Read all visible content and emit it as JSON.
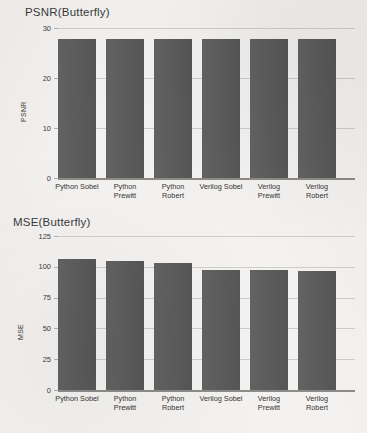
{
  "document": {
    "kind": "scanned-figure-page",
    "background_color": "#f3f2f0",
    "bar_color": "#5a5a5a",
    "grid_color": "#cfcdc9",
    "axis_color": "#8d8b88"
  },
  "charts": [
    {
      "id": "psnr",
      "title": "PSNR(Butterfly)",
      "ylabel": "PSNR",
      "yticks": [
        "30",
        "20",
        "10",
        "0"
      ]
    },
    {
      "id": "mse",
      "title": "MSE(Butterfly)",
      "ylabel": "MSE",
      "yticks": [
        "125",
        "100",
        "75",
        "50",
        "25",
        "0"
      ]
    }
  ],
  "categories": [
    "Python Sobel",
    "Python\nPrewitt",
    "Python\nRobert",
    "Verilog Sobel",
    "Verilog\nPrewitt",
    "Verilog\nRobert"
  ],
  "chart_data": [
    {
      "type": "bar",
      "title": "PSNR(Butterfly)",
      "xlabel": "",
      "ylabel": "PSNR",
      "ylim": [
        0,
        30
      ],
      "yticks": [
        0,
        10,
        20,
        30
      ],
      "grid": true,
      "legend": "none",
      "categories": [
        "Python Sobel",
        "Python Prewitt",
        "Python Robert",
        "Verilog Sobel",
        "Verilog Prewitt",
        "Verilog Robert"
      ],
      "values": [
        27.9,
        27.9,
        27.9,
        27.9,
        27.9,
        27.8
      ]
    },
    {
      "type": "bar",
      "title": "MSE(Butterfly)",
      "xlabel": "",
      "ylabel": "MSE",
      "ylim": [
        0,
        125
      ],
      "yticks": [
        0,
        25,
        50,
        75,
        100,
        125
      ],
      "grid": true,
      "legend": "none",
      "categories": [
        "Python Sobel",
        "Python Prewitt",
        "Python Robert",
        "Verilog Sobel",
        "Verilog Prewitt",
        "Verilog Robert"
      ],
      "values": [
        106.5,
        105,
        103,
        97.5,
        97,
        96.5
      ]
    }
  ]
}
